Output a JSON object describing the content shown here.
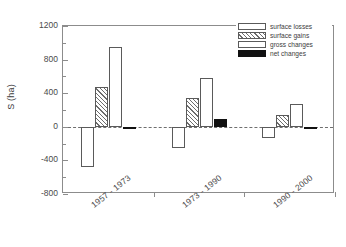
{
  "chart_data": {
    "type": "bar",
    "title": "",
    "subtitle": "",
    "xlabel": "",
    "ylabel": "S (ha)",
    "ylim": [
      -800,
      1200
    ],
    "ytick_labels": [
      "1200",
      "800",
      "400",
      "0",
      "-400",
      "-800"
    ],
    "ytick_values": [
      1200,
      800,
      400,
      0,
      -400,
      -800
    ],
    "yminor_values": [
      1000,
      600,
      200,
      -200,
      -600
    ],
    "grid": false,
    "zero_line": true,
    "legend_position": "top-right",
    "categories": [
      "1957 - 1973",
      "1973 - 1990",
      "1990 - 2000"
    ],
    "series": [
      {
        "name": "surface losses",
        "fill": "white",
        "values": [
          -480,
          -250,
          -130
        ]
      },
      {
        "name": "surface gains",
        "fill": "hatched",
        "values": [
          470,
          340,
          145
        ]
      },
      {
        "name": "gross changes",
        "fill": "white",
        "values": [
          955,
          580,
          270
        ]
      },
      {
        "name": "net changes",
        "fill": "black",
        "values": [
          -10,
          90,
          -25
        ]
      }
    ]
  },
  "legend": {
    "entries": [
      {
        "label": "surface losses"
      },
      {
        "label": "surface gains"
      },
      {
        "label": "gross changes"
      },
      {
        "label": "net changes"
      }
    ]
  },
  "colors": {
    "axis": "#8c8c8c",
    "bar_outline": "#5a5a5a",
    "net_fill": "#111111",
    "text": "#3d3d3d",
    "background": "#ffffff"
  }
}
